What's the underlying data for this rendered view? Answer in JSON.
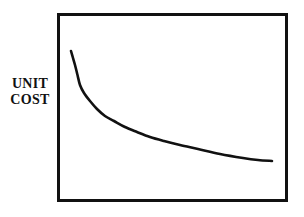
{
  "figure": {
    "background_color": "#ffffff",
    "ink_color": "#111111"
  },
  "axis_label": {
    "name": "unit-cost-axis-label",
    "line1": "UNIT",
    "line2": "COST"
  },
  "plot_frame": {
    "name": "plot-frame",
    "stroke_color": "#111111",
    "stroke_width": 3,
    "left": 58.5,
    "top": 14.5,
    "right": 286.5,
    "bottom": 200.5
  },
  "chart_data": {
    "type": "line",
    "title": "",
    "subtitle": "",
    "xlabel": "",
    "ylabel": "UNIT COST",
    "xlim": [
      58,
      287
    ],
    "ylim": [
      200,
      14
    ],
    "grid": false,
    "legend": null,
    "axis_ticks": {
      "x": [],
      "y": []
    },
    "annotations": [],
    "series": [
      {
        "name": "unit-cost-curve",
        "color": "#111111",
        "width": 2.6,
        "description": "Monotonically decreasing convex curve (experience / learning curve): unit cost falls steeply at first then flattens toward an asymptote.",
        "points": [
          [
            71,
            51
          ],
          [
            73,
            58
          ],
          [
            75,
            65
          ],
          [
            77.5,
            75
          ],
          [
            80,
            85
          ],
          [
            84,
            93
          ],
          [
            90,
            101
          ],
          [
            97,
            109
          ],
          [
            105,
            116
          ],
          [
            114,
            121
          ],
          [
            125,
            127
          ],
          [
            137,
            132
          ],
          [
            150,
            137
          ],
          [
            164,
            141
          ],
          [
            180,
            145
          ],
          [
            198,
            149
          ],
          [
            220,
            154
          ],
          [
            243,
            158
          ],
          [
            258,
            160
          ],
          [
            272,
            161
          ]
        ]
      }
    ]
  }
}
